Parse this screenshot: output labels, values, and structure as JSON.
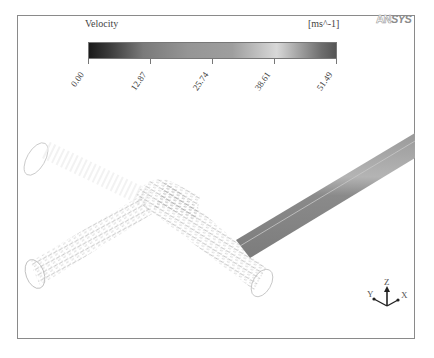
{
  "legend": {
    "title": "Velocity",
    "units": "[ms^-1]",
    "ticks": [
      "0.00",
      "12.87",
      "25.74",
      "38.61",
      "51.49"
    ],
    "min": 0.0,
    "max": 51.49
  },
  "logo": {
    "part1": "AN",
    "part2": "SYS"
  },
  "axes": {
    "x": "X",
    "y": "Y",
    "z": "Z"
  },
  "colors": {
    "frame": "#8a8a8a",
    "pipe_fill": "#8e8e8e",
    "vectors": "#a8a8a8",
    "outline": "#c8c8c8"
  },
  "caption": ""
}
